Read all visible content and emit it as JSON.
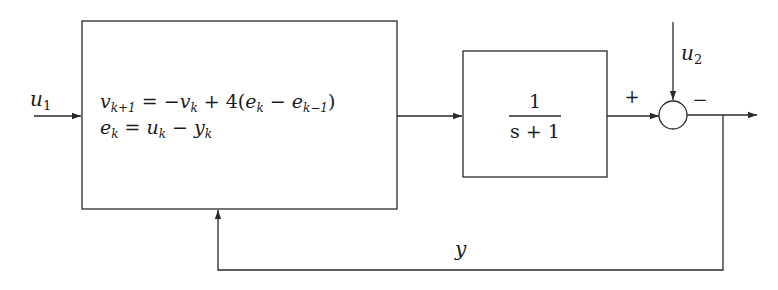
{
  "diagram": {
    "type": "block-diagram",
    "title": "",
    "inputs": {
      "u1": {
        "base": "u",
        "sub": "1"
      },
      "u2": {
        "base": "u",
        "sub": "2"
      }
    },
    "controller_block": {
      "line1": {
        "lhs_base": "v",
        "lhs_sub": "k+1",
        "eq": "=",
        "rhs_part1": "−",
        "rhs_v": "v",
        "rhs_v_sub": "k",
        "rhs_part2": " + 4(",
        "rhs_e1": "e",
        "rhs_e1_sub": "k",
        "rhs_minus": " − ",
        "rhs_e2": "e",
        "rhs_e2_sub": "k−1",
        "rhs_close": ")"
      },
      "line2": {
        "lhs_base": "e",
        "lhs_sub": "k",
        "eq": "=",
        "u": "u",
        "u_sub": "k",
        "minus": " − ",
        "y": "y",
        "y_sub": "k"
      }
    },
    "plant_block": {
      "numerator": "1",
      "denominator": "s + 1"
    },
    "summing_junction": {
      "plus_sign": "+",
      "minus_sign": "−"
    },
    "feedback_label": "y",
    "colors": {
      "line": "#2a2a2a",
      "text": "#1a1a1a",
      "background": "#ffffff"
    }
  }
}
